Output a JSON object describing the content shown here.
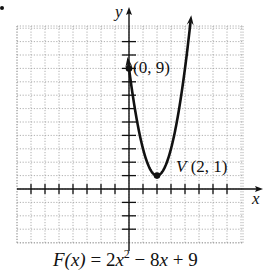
{
  "chart_data": {
    "type": "line",
    "title": "",
    "equation": {
      "lhs": "F(x)",
      "equals": "=",
      "coef_a": "2x",
      "exponent": "2",
      "rest": "− 8x + 9"
    },
    "function": {
      "a": 2,
      "b": -8,
      "c": 9
    },
    "xlabel": "x",
    "ylabel": "y",
    "xlim": [
      -8,
      8
    ],
    "ylim": [
      -4,
      13
    ],
    "x_ticks": [
      -7,
      -6,
      -5,
      -4,
      -3,
      -2,
      -1,
      1,
      2,
      3,
      4,
      5,
      6,
      7
    ],
    "y_ticks": [
      -3,
      -2,
      -1,
      1,
      2,
      3,
      4,
      5,
      6,
      7,
      8,
      9,
      10,
      11
    ],
    "grid": true,
    "curve_x_range": [
      -0.05,
      4.4
    ],
    "points": [
      {
        "x": 0,
        "y": 9,
        "label": "(0, 9)"
      },
      {
        "x": 2,
        "y": 1,
        "label": "V (2, 1)",
        "prefix": "V",
        "coords": "(2, 1)"
      }
    ],
    "series": [
      {
        "name": "F(x) = 2x^2 - 8x + 9",
        "x": [
          0,
          1,
          2,
          3,
          4
        ],
        "values": [
          9,
          3,
          1,
          3,
          9
        ]
      }
    ]
  },
  "layout": {
    "origin_px": [
      129,
      189
    ],
    "unit_x_px": 14,
    "unit_y_px": 13.4,
    "grid_box": [
      17,
      26,
      243,
      243
    ],
    "colors": {
      "ink": "#111111",
      "grid": "#9a9a9a",
      "background": "#ffffff"
    }
  }
}
